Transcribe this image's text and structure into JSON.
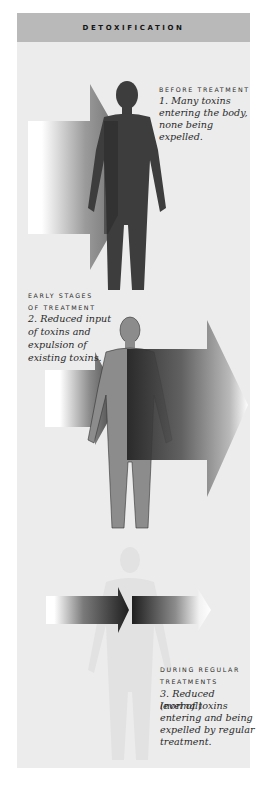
{
  "header": {
    "title": "DETOXIFICATION"
  },
  "stages": [
    {
      "label_lines": [
        "BEFORE TREATMENT"
      ],
      "description_lines": [
        "1. Many toxins",
        "entering the body,",
        "none being expelled."
      ]
    },
    {
      "label_lines": [
        "EARLY STAGES",
        "OF TREATMENT"
      ],
      "description_lines": [
        "2. Reduced input",
        "of toxins and",
        "expulsion of",
        "existing toxins."
      ]
    },
    {
      "label_lines": [
        "DURING REGULAR",
        "TREATMENTS"
      ],
      "description_lines": [
        "3. Reduced (normal)",
        "level of toxins",
        "entering and being",
        "expelled by regular",
        "treatment."
      ]
    }
  ],
  "colors": {
    "panel_bg": "#ececec",
    "header_bg": "#b9b9b9",
    "figure_dark": "#3d3d3d",
    "figure_mid": "#8a8a8a",
    "figure_faint": "#e4e4e4",
    "arrow_dark": "#2b2b2b"
  }
}
